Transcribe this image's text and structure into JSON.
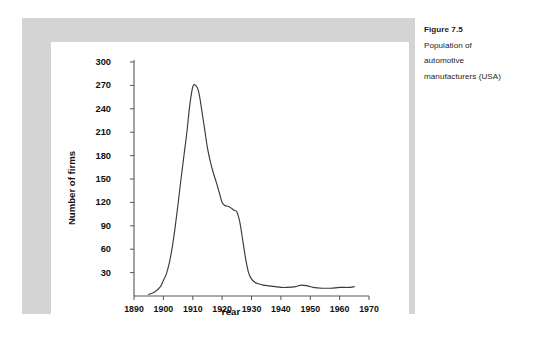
{
  "caption": {
    "title": "Figure 7.5",
    "lines": [
      "Population of",
      "automotive",
      "manufacturers (USA)"
    ]
  },
  "colors": {
    "panel_gray": "#d4d4d4",
    "card_white": "#ffffff",
    "axis": "#555555",
    "line": "#3a3a3a",
    "text": "#111111"
  },
  "chart_data": {
    "type": "line",
    "title": "",
    "xlabel": "Year",
    "ylabel": "Number of firms",
    "xlim": [
      1890,
      1970
    ],
    "ylim": [
      0,
      300
    ],
    "grid": false,
    "legend": null,
    "xticks": [
      1890,
      1900,
      1910,
      1920,
      1930,
      1940,
      1950,
      1960,
      1970
    ],
    "xtick_labels": [
      "1890",
      "1900",
      "1910",
      "1920",
      "1930",
      "1940",
      "1950",
      "1960",
      "1970"
    ],
    "yticks": [
      30,
      60,
      90,
      120,
      150,
      180,
      210,
      240,
      270,
      300
    ],
    "ytick_labels": [
      "30",
      "60",
      "90",
      "120",
      "150",
      "180",
      "210",
      "240",
      "270",
      "300"
    ],
    "series": [
      {
        "name": "Number of automotive manufacturers",
        "x": [
          1895,
          1897,
          1899,
          1900,
          1901,
          1902,
          1903,
          1904,
          1905,
          1906,
          1907,
          1908,
          1909,
          1910,
          1911,
          1912,
          1913,
          1914,
          1915,
          1916,
          1917,
          1918,
          1919,
          1920,
          1921,
          1922,
          1923,
          1924,
          1925,
          1926,
          1927,
          1928,
          1929,
          1930,
          1931,
          1932,
          1934,
          1936,
          1938,
          1940,
          1942,
          1945,
          1947,
          1949,
          1951,
          1954,
          1957,
          1960,
          1963,
          1965
        ],
        "y": [
          2,
          5,
          12,
          20,
          28,
          42,
          62,
          88,
          118,
          150,
          180,
          210,
          245,
          268,
          270,
          262,
          240,
          215,
          190,
          172,
          158,
          146,
          133,
          120,
          116,
          115,
          113,
          110,
          108,
          95,
          72,
          48,
          30,
          22,
          18,
          16,
          14,
          13,
          12,
          11,
          11,
          12,
          14,
          13,
          11,
          10,
          10,
          11,
          11,
          12
        ]
      }
    ]
  }
}
